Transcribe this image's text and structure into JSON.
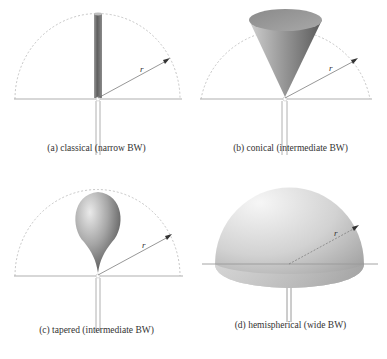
{
  "figure": {
    "panels": [
      {
        "id": "a",
        "caption": "(a) classical (narrow BW)",
        "shape": "cylinder",
        "radius_label": "r"
      },
      {
        "id": "b",
        "caption": "(b) conical (intermediate BW)",
        "shape": "cone",
        "radius_label": "r"
      },
      {
        "id": "c",
        "caption": "(c) tapered (intermediate BW)",
        "shape": "teardrop",
        "radius_label": "r"
      },
      {
        "id": "d",
        "caption": "(d) hemispherical (wide BW)",
        "shape": "hemisphere",
        "radius_label": "r"
      }
    ],
    "colors": {
      "ground_line": "#b0b0b0",
      "dashed_arc": "#b8b8b8",
      "radius_arrow": "#555555",
      "monopole_dark": "#6a6a6a",
      "monopole_light": "#e8e8e8"
    }
  }
}
